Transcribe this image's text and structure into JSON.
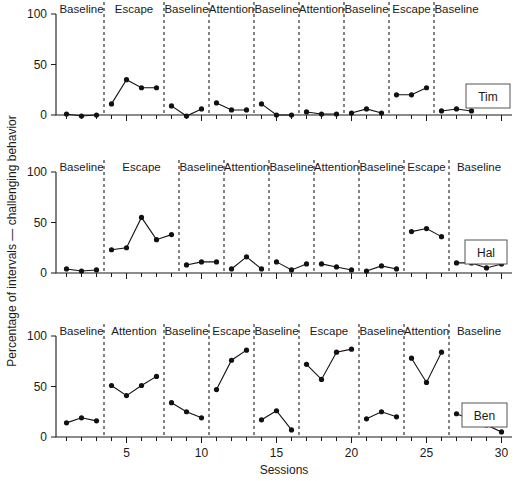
{
  "figure": {
    "title": "",
    "x_axis_label": "Sessions",
    "y_axis_label": "Percentage of intervals — challenging behavior"
  },
  "chart_data": {
    "type": "line",
    "title": "",
    "xlabel": "Sessions",
    "ylabel": "Percentage of intervals — challenging behavior",
    "xlim": [
      0.3,
      30.7
    ],
    "ylim": [
      0,
      100
    ],
    "grid": false,
    "legend_position": "inside-right",
    "x_ticks_major": [
      5,
      10,
      15,
      20,
      25,
      30
    ],
    "x_ticks_minor": [
      1,
      2,
      3,
      4,
      6,
      7,
      8,
      9,
      11,
      12,
      13,
      14,
      16,
      17,
      18,
      19,
      21,
      22,
      23,
      24,
      26,
      27,
      28,
      29
    ],
    "y_ticks": [
      0,
      50,
      100
    ],
    "panels": [
      {
        "name": "Tim",
        "legend_label": "Tim",
        "phases": [
          {
            "label": "Baseline",
            "x": [
              1,
              2,
              3
            ],
            "y": [
              1,
              -1,
              0
            ]
          },
          {
            "label": "Escape",
            "x": [
              4,
              5,
              6,
              7
            ],
            "y": [
              11,
              35,
              27,
              27
            ]
          },
          {
            "label": "Baseline",
            "x": [
              8,
              9,
              10
            ],
            "y": [
              9,
              -1,
              6
            ]
          },
          {
            "label": "Attention",
            "x": [
              11,
              12,
              13
            ],
            "y": [
              12,
              5,
              5
            ]
          },
          {
            "label": "Baseline",
            "x": [
              14,
              15,
              16
            ],
            "y": [
              11,
              0,
              0
            ]
          },
          {
            "label": "Attention",
            "x": [
              17,
              18,
              19
            ],
            "y": [
              3,
              1,
              1
            ]
          },
          {
            "label": "Baseline",
            "x": [
              20,
              21,
              22
            ],
            "y": [
              2,
              6,
              2
            ]
          },
          {
            "label": "Escape",
            "x": [
              23,
              24,
              25
            ],
            "y": [
              20,
              20,
              27
            ]
          },
          {
            "label": "Baseline",
            "x": [
              26,
              27,
              28
            ],
            "y": [
              4,
              6,
              4
            ]
          }
        ]
      },
      {
        "name": "Hal",
        "legend_label": "Hal",
        "phases": [
          {
            "label": "Baseline",
            "x": [
              1,
              2,
              3
            ],
            "y": [
              4,
              2,
              3
            ]
          },
          {
            "label": "Escape",
            "x": [
              4,
              5,
              6,
              7,
              8
            ],
            "y": [
              23,
              25,
              55,
              33,
              38
            ]
          },
          {
            "label": "Baseline",
            "x": [
              9,
              10,
              11
            ],
            "y": [
              8,
              11,
              11
            ]
          },
          {
            "label": "Attention",
            "x": [
              12,
              13,
              14
            ],
            "y": [
              4,
              16,
              4
            ]
          },
          {
            "label": "Baseline",
            "x": [
              15,
              16,
              17
            ],
            "y": [
              11,
              3,
              9
            ]
          },
          {
            "label": "Attention",
            "x": [
              18,
              19,
              20
            ],
            "y": [
              9,
              6,
              3
            ]
          },
          {
            "label": "Baseline",
            "x": [
              21,
              22,
              23
            ],
            "y": [
              2,
              7,
              4
            ]
          },
          {
            "label": "Escape",
            "x": [
              24,
              25,
              26
            ],
            "y": [
              41,
              44,
              36
            ]
          },
          {
            "label": "Baseline",
            "x": [
              27,
              28,
              29,
              30
            ],
            "y": [
              10,
              10,
              5,
              9
            ]
          }
        ]
      },
      {
        "name": "Ben",
        "legend_label": "Ben",
        "phases": [
          {
            "label": "Baseline",
            "x": [
              1,
              2,
              3
            ],
            "y": [
              14,
              19,
              16
            ]
          },
          {
            "label": "Attention",
            "x": [
              4,
              5,
              6,
              7
            ],
            "y": [
              51,
              41,
              51,
              60
            ]
          },
          {
            "label": "Baseline",
            "x": [
              8,
              9,
              10
            ],
            "y": [
              34,
              25,
              19
            ]
          },
          {
            "label": "Escape",
            "x": [
              11,
              12,
              13
            ],
            "y": [
              47,
              76,
              86
            ]
          },
          {
            "label": "Baseline",
            "x": [
              14,
              15,
              16
            ],
            "y": [
              17,
              26,
              7
            ]
          },
          {
            "label": "Escape",
            "x": [
              17,
              18,
              19,
              20
            ],
            "y": [
              72,
              57,
              84,
              87
            ]
          },
          {
            "label": "Baseline",
            "x": [
              21,
              22,
              23
            ],
            "y": [
              18,
              25,
              20
            ]
          },
          {
            "label": "Attention",
            "x": [
              24,
              25,
              26
            ],
            "y": [
              78,
              54,
              84
            ]
          },
          {
            "label": "Baseline",
            "x": [
              27,
              28,
              29,
              30
            ],
            "y": [
              23,
              17,
              12,
              5
            ]
          }
        ]
      }
    ]
  },
  "colors": {
    "axis": "#1a1a1a",
    "series": "#111111",
    "divider": "#202020",
    "legend_border": "#555555",
    "background": "#ffffff"
  }
}
